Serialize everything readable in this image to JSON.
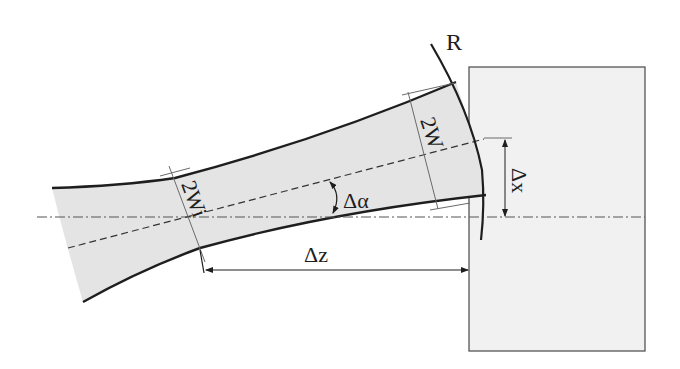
{
  "diagram": {
    "type": "gaussian-beam-reflection-geometry",
    "labels": {
      "radius": "R",
      "waist": "2Wi",
      "beam_width": "2W",
      "angle": "Δα",
      "lateral_offset": "Δx",
      "axial_distance": "Δz"
    },
    "elements": [
      {
        "name": "gaussian-beam",
        "description": "shaded beam envelope narrowing to waist then expanding"
      },
      {
        "name": "optical-axis",
        "style": "dash-dot"
      },
      {
        "name": "beam-axis",
        "style": "dashed",
        "tilted_by": "Δα"
      },
      {
        "name": "curved-surface",
        "label": "R"
      },
      {
        "name": "target-block",
        "style": "light-gray rectangle"
      }
    ],
    "colors": {
      "line": "#1e1e1e",
      "beam_fill": "#e4e4e4",
      "block_fill": "#f1f1f1",
      "thin_line": "#6a6a6a"
    }
  }
}
